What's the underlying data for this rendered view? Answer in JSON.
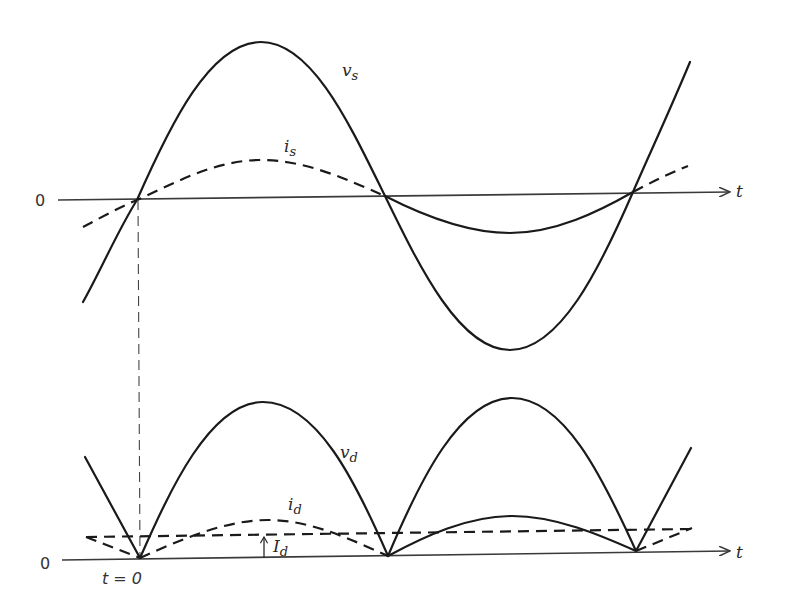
{
  "top_plot": {
    "axis_zero_label": "0",
    "axis_t_label": "t",
    "v_s": {
      "label": "v",
      "sub": "s"
    },
    "i_s": {
      "label": "i",
      "sub": "s"
    }
  },
  "bottom_plot": {
    "axis_zero_label": "0",
    "axis_t_label": "t",
    "t0_label": "t = 0",
    "v_d": {
      "label": "v",
      "sub": "d"
    },
    "i_d": {
      "label": "i",
      "sub": "d"
    },
    "I_d": {
      "label": "I",
      "sub": "d"
    }
  },
  "colors": {
    "line": "#1a1a1a",
    "axis": "#3a3a3a",
    "background": "#ffffff"
  }
}
